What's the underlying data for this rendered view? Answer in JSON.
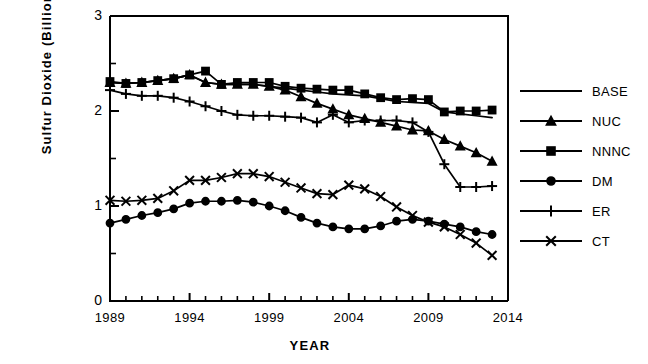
{
  "chart_data": {
    "type": "line",
    "title": "",
    "xlabel": "YEAR",
    "ylabel": "Sulfur Dioxide  (Billion  Lbs)",
    "xlim": [
      1989,
      2014
    ],
    "ylim": [
      0,
      3
    ],
    "xticks": [
      1989,
      1994,
      1999,
      2004,
      2009,
      2014
    ],
    "xticklabels": [
      "1989",
      "1994",
      "1999",
      "2004",
      "2009",
      "2014"
    ],
    "yticks": [
      0,
      1,
      2,
      3
    ],
    "yticklabels": [
      "0",
      "1",
      "2",
      "3"
    ],
    "minor_x_interval": 1,
    "minor_y_interval": 0.5,
    "grid": false,
    "legend_position": "right",
    "x": [
      1989,
      1990,
      1991,
      1992,
      1993,
      1994,
      1995,
      1996,
      1997,
      1998,
      1999,
      2000,
      2001,
      2002,
      2003,
      2004,
      2005,
      2006,
      2007,
      2008,
      2009,
      2010,
      2011,
      2012,
      2013
    ],
    "series": [
      {
        "name": "BASE",
        "marker": "none",
        "values": [
          2.3,
          2.29,
          2.3,
          2.32,
          2.34,
          2.38,
          2.3,
          2.28,
          2.28,
          2.28,
          2.26,
          2.24,
          2.22,
          2.2,
          2.18,
          2.17,
          2.16,
          2.13,
          2.1,
          2.09,
          2.08,
          1.99,
          1.97,
          1.95,
          1.93
        ]
      },
      {
        "name": "NUC",
        "marker": "triangle",
        "values": [
          2.3,
          2.29,
          2.3,
          2.32,
          2.34,
          2.38,
          2.3,
          2.28,
          2.28,
          2.28,
          2.26,
          2.22,
          2.15,
          2.08,
          2.02,
          1.96,
          1.92,
          1.88,
          1.84,
          1.8,
          1.79,
          1.7,
          1.63,
          1.56,
          1.47
        ]
      },
      {
        "name": "NNNC",
        "marker": "square",
        "values": [
          2.31,
          2.29,
          2.3,
          2.32,
          2.34,
          2.38,
          2.42,
          2.28,
          2.3,
          2.3,
          2.3,
          2.26,
          2.24,
          2.23,
          2.22,
          2.22,
          2.18,
          2.14,
          2.12,
          2.13,
          2.12,
          1.99,
          2.0,
          2.0,
          2.01
        ]
      },
      {
        "name": "DM",
        "marker": "circle",
        "values": [
          0.82,
          0.86,
          0.9,
          0.93,
          0.97,
          1.03,
          1.05,
          1.05,
          1.06,
          1.04,
          1.0,
          0.95,
          0.88,
          0.82,
          0.78,
          0.76,
          0.76,
          0.79,
          0.84,
          0.86,
          0.84,
          0.81,
          0.78,
          0.73,
          0.7
        ]
      },
      {
        "name": "ER",
        "marker": "plus",
        "values": [
          2.22,
          2.18,
          2.16,
          2.16,
          2.14,
          2.1,
          2.05,
          2.0,
          1.96,
          1.95,
          1.95,
          1.94,
          1.93,
          1.88,
          1.96,
          1.88,
          1.9,
          1.9,
          1.9,
          1.88,
          1.78,
          1.44,
          1.2,
          1.2,
          1.21
        ]
      },
      {
        "name": "CT",
        "marker": "cross",
        "values": [
          1.06,
          1.05,
          1.06,
          1.08,
          1.16,
          1.27,
          1.27,
          1.3,
          1.34,
          1.34,
          1.31,
          1.25,
          1.19,
          1.13,
          1.12,
          1.22,
          1.18,
          1.1,
          0.99,
          0.9,
          0.83,
          0.78,
          0.7,
          0.61,
          0.48
        ]
      }
    ]
  },
  "legend": {
    "entries": [
      {
        "label": "BASE",
        "marker": "none"
      },
      {
        "label": "NUC",
        "marker": "triangle"
      },
      {
        "label": "NNNC",
        "marker": "square"
      },
      {
        "label": "DM",
        "marker": "circle"
      },
      {
        "label": "ER",
        "marker": "plus"
      },
      {
        "label": "CT",
        "marker": "cross"
      }
    ]
  },
  "colors": {
    "line": "#000000",
    "axis": "#000000",
    "background": "#ffffff"
  }
}
